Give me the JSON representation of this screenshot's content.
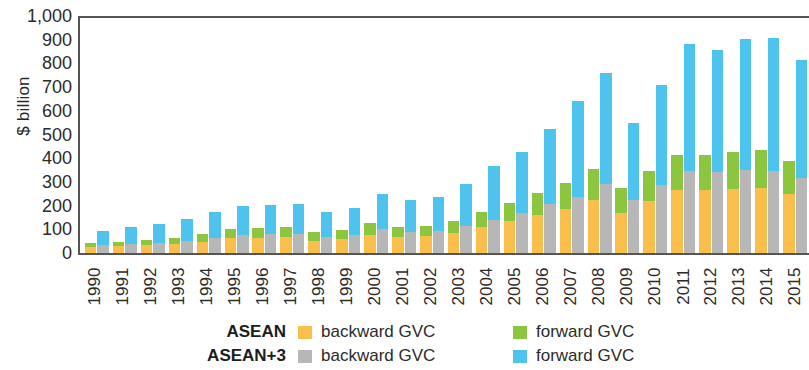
{
  "chart_data": {
    "type": "bar",
    "subtype": "grouped-stacked",
    "title": "",
    "xlabel": "",
    "ylabel": "$ billion",
    "ylim": [
      0,
      1000
    ],
    "yticks": [
      0,
      100,
      200,
      300,
      400,
      500,
      600,
      700,
      800,
      900,
      1000
    ],
    "ytick_labels": [
      "0",
      "100",
      "200",
      "300",
      "400",
      "500",
      "600",
      "700",
      "800",
      "900",
      "1,000"
    ],
    "grid": false,
    "legend_position": "bottom",
    "categories": [
      "1990",
      "1991",
      "1992",
      "1993",
      "1994",
      "1995",
      "1996",
      "1997",
      "1998",
      "1999",
      "2000",
      "2001",
      "2002",
      "2003",
      "2004",
      "2005",
      "2006",
      "2007",
      "2008",
      "2009",
      "2010",
      "2011",
      "2012",
      "2013",
      "2014",
      "2015"
    ],
    "groups": [
      {
        "name": "ASEAN",
        "series": [
          {
            "name": "backward GVC",
            "color": "#F9BE4B",
            "values": [
              25,
              28,
              33,
              38,
              48,
              62,
              65,
              66,
              52,
              58,
              78,
              67,
              70,
              83,
              110,
              135,
              160,
              185,
              225,
              170,
              220,
              265,
              265,
              270,
              275,
              250
            ]
          },
          {
            "name": "forward GVC",
            "color": "#8CC63E",
            "values": [
              18,
              20,
              23,
              26,
              32,
              38,
              40,
              42,
              35,
              38,
              48,
              43,
              45,
              53,
              65,
              78,
              95,
              110,
              130,
              105,
              125,
              150,
              150,
              155,
              158,
              140
            ]
          }
        ]
      },
      {
        "name": "ASEAN+3",
        "series": [
          {
            "name": "backward GVC",
            "color": "#B7B7B7",
            "values": [
              33,
              38,
              43,
              50,
              63,
              78,
              80,
              82,
              68,
              75,
              100,
              90,
              95,
              115,
              140,
              170,
              205,
              235,
              290,
              225,
              285,
              345,
              340,
              350,
              348,
              315
            ]
          },
          {
            "name": "forward GVC",
            "color": "#4EC3EE",
            "values": [
              62,
              70,
              80,
              95,
              108,
              120,
              123,
              125,
              105,
              113,
              150,
              135,
              142,
              175,
              228,
              255,
              320,
              405,
              470,
              325,
              425,
              535,
              515,
              555,
              560,
              500
            ]
          }
        ]
      }
    ],
    "totals": {
      "ASEAN": [
        43,
        48,
        56,
        64,
        80,
        100,
        105,
        108,
        87,
        96,
        126,
        110,
        115,
        136,
        175,
        213,
        255,
        295,
        355,
        275,
        345,
        415,
        415,
        425,
        433,
        390
      ],
      "ASEAN+3": [
        95,
        108,
        123,
        145,
        171,
        198,
        203,
        207,
        173,
        188,
        250,
        225,
        237,
        290,
        368,
        425,
        525,
        640,
        760,
        550,
        710,
        880,
        855,
        905,
        908,
        815
      ]
    }
  },
  "legend": {
    "rows": [
      {
        "group": "ASEAN",
        "entries": [
          {
            "label": "backward GVC",
            "swatch": "backward-asean"
          },
          {
            "label": "forward GVC",
            "swatch": "forward-asean"
          }
        ]
      },
      {
        "group": "ASEAN+3",
        "entries": [
          {
            "label": "backward GVC",
            "swatch": "backward-aplus"
          },
          {
            "label": "forward GVC",
            "swatch": "forward-aplus"
          }
        ]
      }
    ]
  }
}
